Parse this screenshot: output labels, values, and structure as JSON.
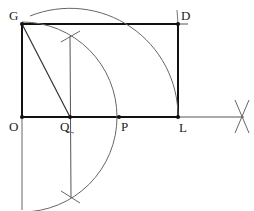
{
  "diagram": {
    "title": "",
    "labels": {
      "G": "G",
      "D": "D",
      "O": "O",
      "Q": "Q",
      "P": "P",
      "L": "L"
    },
    "points": {
      "G": [
        22,
        24
      ],
      "D": [
        178,
        24
      ],
      "O": [
        22,
        117
      ],
      "Q": [
        70,
        117
      ],
      "P": [
        119,
        117
      ],
      "L": [
        178,
        117
      ]
    },
    "colors": {
      "thick_line": "#111111",
      "thin_line": "#555555",
      "arc": "#666666"
    }
  }
}
